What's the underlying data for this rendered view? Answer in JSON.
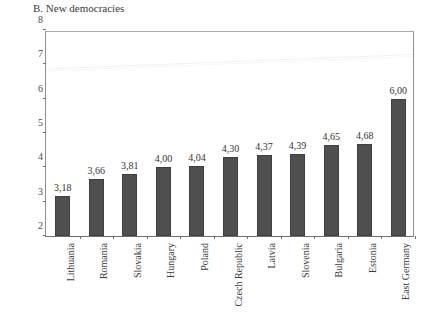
{
  "chart_data": {
    "type": "bar",
    "title": "B. New democracies",
    "xlabel": "",
    "ylabel": "",
    "ylim": [
      2,
      8
    ],
    "grid": false,
    "legend": null,
    "decimal_separator": ",",
    "categories": [
      "Lithuania",
      "Romania",
      "Slovakia",
      "Hungary",
      "Poland",
      "Czech Republic",
      "Latvia",
      "Slovenia",
      "Bulgaria",
      "Estonia",
      "East Germany"
    ],
    "values": [
      3.18,
      3.66,
      3.81,
      4.0,
      4.04,
      4.3,
      4.37,
      4.39,
      4.65,
      4.68,
      6.0
    ],
    "value_labels": [
      "3,18",
      "3,66",
      "3,81",
      "4,00",
      "4,04",
      "4,30",
      "4,37",
      "4,39",
      "4,65",
      "4,68",
      "6,00"
    ],
    "y_ticks": [
      2,
      3,
      4,
      5,
      6,
      7,
      8
    ],
    "y_tick_labels": [
      "2",
      "3",
      "4",
      "5",
      "6",
      "7",
      "8"
    ],
    "bar_color": "#4f4f4f",
    "bar_edge_color": "#3f3f3f",
    "axis_color": "#6f6f6f",
    "background": "#ffffff"
  }
}
